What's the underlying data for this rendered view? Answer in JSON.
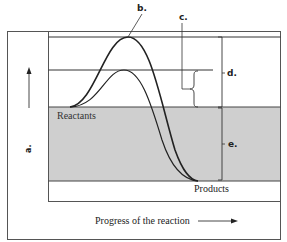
{
  "diagram": {
    "type": "energy-profile",
    "colors": {
      "line": "#222222",
      "shaded": "#cfcfcf",
      "frame": "#555555",
      "background": "#ffffff"
    },
    "labels": {
      "a": "a.",
      "b": "b.",
      "c": "c.",
      "d": "d.",
      "e": "e.",
      "reactants": "Reactants",
      "products": "Products",
      "x_axis": "Progress of the reaction"
    },
    "curves": [
      {
        "name": "uncatalyzed",
        "peak_y": 37
      },
      {
        "name": "catalyzed",
        "peak_y": 70
      }
    ]
  }
}
